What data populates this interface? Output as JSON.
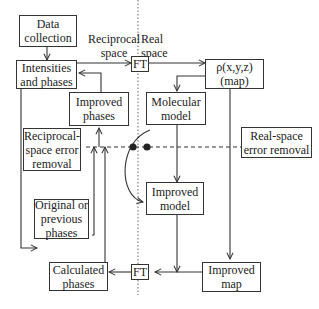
{
  "diagram": {
    "region_labels": {
      "reciprocal": "Reciprocal\nspace",
      "real": "Real\nspace"
    },
    "nodes": {
      "data_collection": "Data\ncollection",
      "intensities_phases": "Intensities\nand phases",
      "ft_top": "FT",
      "density_map": "ρ(x,y,z)\n(map)",
      "improved_phases": "Improved\nphases",
      "molecular_model": "Molecular\nmodel",
      "reciprocal_error": "Reciprocal-\nspace error\nremoval",
      "real_error": "Real-space\nerror removal",
      "improved_model": "Improved\nmodel",
      "original_phases": "Original or\nprevious\nphases",
      "calculated_phases": "Calculated\nphases",
      "ft_bottom": "FT",
      "improved_map": "Improved\nmap"
    },
    "edges": [
      {
        "from": "Data collection",
        "to": "Intensities and phases"
      },
      {
        "from": "Intensities and phases",
        "to": "FT"
      },
      {
        "from": "FT",
        "to": "ρ(x,y,z) (map)"
      },
      {
        "from": "ρ(x,y,z) (map)",
        "to": "Molecular model"
      },
      {
        "from": "Molecular model",
        "to": "Improved model"
      },
      {
        "from": "Molecular model",
        "to": "Improved model",
        "style": "curved"
      },
      {
        "from": "ρ(x,y,z) (map)",
        "to": "Improved map"
      },
      {
        "from": "Improved model",
        "to": "Improved map line"
      },
      {
        "from": "Improved map",
        "to": "FT (bottom)"
      },
      {
        "from": "FT (bottom)",
        "to": "Calculated phases"
      },
      {
        "from": "Calculated phases",
        "to": "Improved phases"
      },
      {
        "from": "Original or previous phases",
        "to": "Improved phases"
      },
      {
        "from": "Improved phases",
        "to": "Intensities and phases"
      },
      {
        "from": "Intensities and phases",
        "to": "Original or previous phases"
      },
      {
        "from": "Reciprocal-space error removal",
        "to": "Real-space error removal",
        "style": "dashed"
      }
    ]
  }
}
